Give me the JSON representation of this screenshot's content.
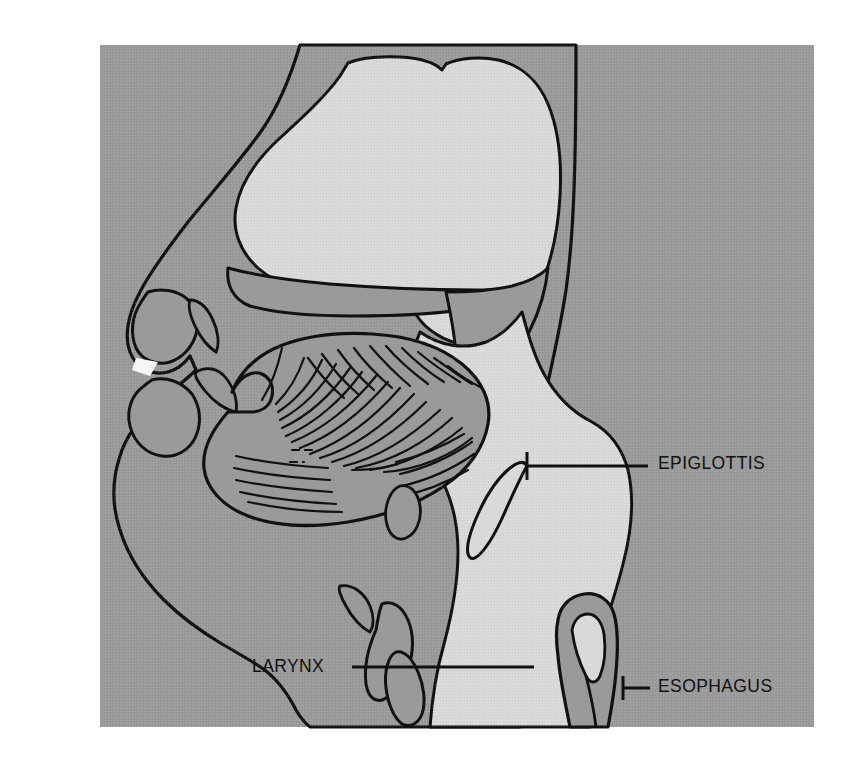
{
  "figure": {
    "kind": "anatomical-illustration",
    "view": "midsagittal section of human head and neck",
    "canvas": {
      "width": 856,
      "height": 764
    },
    "panel": {
      "x": 100,
      "y": 45,
      "width": 714,
      "height": 682
    }
  },
  "palette": {
    "page_background": "#ffffff",
    "panel_background": "#9a9a9a",
    "airway_lumen": "#d9d9d9",
    "soft_tissue": "#9a9a9a",
    "outline": "#111111",
    "label_text": "#111111",
    "leader_line": "#111111",
    "teeth": "#f2f2f2"
  },
  "annotations": [
    {
      "id": "epiglottis",
      "label": "EPIGLOTTIS",
      "text_x": 658,
      "text_y": 464,
      "leader": {
        "x1": 527,
        "y1": 466,
        "x2": 648,
        "y2": 466
      },
      "tick": {
        "x": 527,
        "y1": 452,
        "y2": 480
      }
    },
    {
      "id": "larynx",
      "label": "LARYNX",
      "text_x": 252,
      "text_y": 667,
      "anchor": "end",
      "leader": {
        "x1": 352,
        "y1": 667,
        "x2": 534,
        "y2": 667
      }
    },
    {
      "id": "esophagus",
      "label": "ESOPHAGUS",
      "text_x": 658,
      "text_y": 687,
      "leader": {
        "x1": 623,
        "y1": 688,
        "x2": 650,
        "y2": 688
      },
      "tick": {
        "x": 623,
        "y1": 676,
        "y2": 700
      }
    }
  ],
  "structures": [
    {
      "id": "head-profile",
      "name": "head and neck soft tissue profile",
      "fill": "soft_tissue"
    },
    {
      "id": "nasal-cavity",
      "name": "nasal cavity airway",
      "fill": "airway_lumen"
    },
    {
      "id": "hard-palate",
      "name": "hard palate",
      "fill": "soft_tissue"
    },
    {
      "id": "soft-palate",
      "name": "soft palate and uvula",
      "fill": "soft_tissue"
    },
    {
      "id": "tongue",
      "name": "tongue with radiating muscle striations",
      "fill": "soft_tissue",
      "striation_count": 42
    },
    {
      "id": "upper-lip",
      "name": "upper lip",
      "fill": "soft_tissue"
    },
    {
      "id": "lower-lip",
      "name": "lower lip",
      "fill": "soft_tissue"
    },
    {
      "id": "upper-teeth",
      "name": "upper incisor",
      "fill": "teeth"
    },
    {
      "id": "lower-teeth",
      "name": "lower incisor",
      "fill": "teeth"
    },
    {
      "id": "mandible",
      "name": "mandible and chin",
      "fill": "soft_tissue"
    },
    {
      "id": "oropharynx",
      "name": "oropharynx and laryngopharynx airway",
      "fill": "airway_lumen"
    },
    {
      "id": "epiglottis-flap",
      "name": "epiglottis",
      "fill": "soft_tissue"
    },
    {
      "id": "larynx-body",
      "name": "larynx / vocal folds",
      "fill": "soft_tissue"
    },
    {
      "id": "trachea",
      "name": "tracheal airway",
      "fill": "airway_lumen"
    },
    {
      "id": "esophagus-tube",
      "name": "esophagus with collapsed lumen",
      "fill": "soft_tissue"
    },
    {
      "id": "hyoid",
      "name": "hyoid bone",
      "fill": "soft_tissue"
    }
  ]
}
